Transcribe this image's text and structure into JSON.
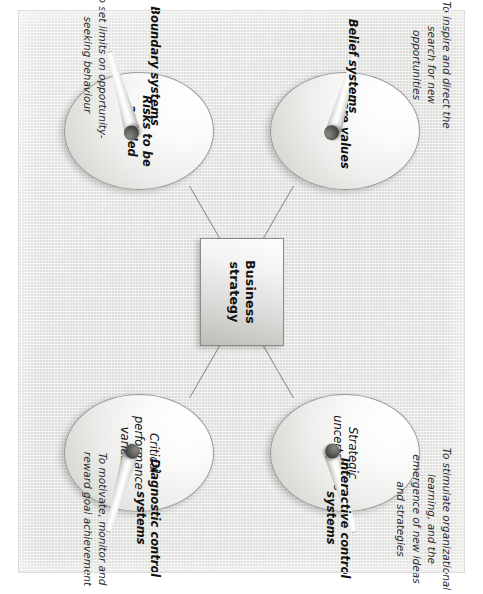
{
  "diagram": {
    "type": "hub-and-spoke",
    "center": {
      "label": "Business strategy",
      "shape": "rectangle"
    },
    "colors": {
      "background": "#e6e6e4",
      "node_fill_light": "#ffffff",
      "node_fill_dark": "#c2c2bf",
      "node_stroke": "#9a9a97",
      "connector": "#8d8d8a",
      "knob": "#3d3d3a",
      "text": "#111111"
    },
    "levers": [
      {
        "id": "belief",
        "system_label": "Belief systems",
        "ellipse_label": "Core values",
        "ellipse_label_bold": true,
        "purpose": "To inspire and direct the search for new opportunities",
        "position": "upper-left"
      },
      {
        "id": "boundary",
        "system_label": "Boundary systems",
        "ellipse_label": "Risks to be avoided",
        "ellipse_label_bold": true,
        "purpose": "To set limits on opportunity-seeking behaviour",
        "position": "lower-left"
      },
      {
        "id": "diagnostic",
        "system_label": "Diagnostic control systems",
        "ellipse_label": "Critical performance variables",
        "ellipse_label_bold": false,
        "purpose": "To motivate, monitor and reward goal achievement",
        "position": "lower-right"
      },
      {
        "id": "interactive",
        "system_label": "Interactive control systems",
        "ellipse_label": "Strategic uncertainties",
        "ellipse_label_bold": false,
        "purpose": "To stimulate organizational learning, and the emergence of new ideas and strategies",
        "position": "upper-right"
      }
    ]
  }
}
